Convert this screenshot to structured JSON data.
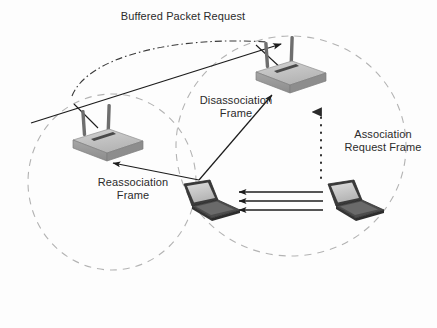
{
  "figure": {
    "name": "wireless-roaming-handoff-diagram",
    "background_color": "#fdfdfd"
  },
  "labels": {
    "buffered_packet_request": "Buffered Packet Request",
    "disassociation_frame": "Disassociation\nFrame",
    "association_request_frame": "Association\nRequest Frame",
    "reassociation_frame": "Reassociation\nFrame"
  },
  "colors": {
    "line": "#1c1c1c",
    "coverage_circle": "#b0b0b0",
    "ap_top_face": "#c2c2c2",
    "ap_front_face": "#9a9a9a",
    "ap_side_face": "#8a8a8a",
    "ap_slot": "#4a4a4a",
    "antenna": "#6e6e6e",
    "laptop_body": "#3b3b3b",
    "laptop_screen": "#c9c9c9",
    "laptop_keyboard": "#585858",
    "text": "#2b2b2b"
  },
  "nodes": [
    {
      "id": "ap-left",
      "type": "access-point",
      "label": "left-access-point",
      "x": 107,
      "y": 140,
      "antennas": 2
    },
    {
      "id": "ap-right",
      "type": "access-point",
      "label": "top-right-access-point",
      "x": 290,
      "y": 72,
      "antennas": 2
    },
    {
      "id": "laptop-left",
      "type": "laptop",
      "label": "roaming-client-laptop",
      "x": 208,
      "y": 201
    },
    {
      "id": "laptop-right",
      "type": "laptop",
      "label": "associating-client-laptop",
      "x": 352,
      "y": 201
    }
  ],
  "coverage_areas": [
    {
      "id": "cell-left",
      "label": "left-coverage-cell",
      "cx": 112,
      "cy": 182,
      "rx": 84,
      "ry": 88,
      "style": "dashed"
    },
    {
      "id": "cell-right",
      "label": "right-coverage-cell",
      "cx": 291,
      "cy": 146,
      "rx": 115,
      "ry": 110,
      "style": "dashed"
    }
  ],
  "flows": [
    {
      "id": "flow-buffered-packet",
      "label": "buffered-packet-request-flow",
      "style": "solid-line-with-arrow",
      "from": "lower-left-edge",
      "to": "top-right-access-point"
    },
    {
      "id": "flow-buffered-packet-arc",
      "label": "buffered-packet-request-arc",
      "style": "dash-dot-curve",
      "from": "left-access-point",
      "to": "top-right-access-point"
    },
    {
      "id": "flow-disassociation",
      "label": "disassociation-frame-flow",
      "style": "solid-arrow",
      "from": "roaming-client-laptop",
      "to": "top-right-access-point"
    },
    {
      "id": "flow-reassociation",
      "label": "reassociation-frame-flow",
      "style": "solid-arrow",
      "from": "roaming-client-laptop",
      "to": "left-access-point"
    },
    {
      "id": "flow-association-request",
      "label": "association-request-frame-flow",
      "style": "dotted-arrow",
      "from": "associating-client-laptop",
      "to": "top-right-access-point"
    },
    {
      "id": "flow-data-1",
      "label": "data-frame-arrow-top",
      "style": "solid-arrow",
      "from": "associating-client-laptop",
      "to": "roaming-client-laptop"
    },
    {
      "id": "flow-data-2",
      "label": "data-frame-arrow-middle",
      "style": "solid-arrow",
      "from": "associating-client-laptop",
      "to": "roaming-client-laptop"
    },
    {
      "id": "flow-data-3",
      "label": "data-frame-arrow-bottom",
      "style": "solid-arrow",
      "from": "associating-client-laptop",
      "to": "roaming-client-laptop"
    }
  ]
}
